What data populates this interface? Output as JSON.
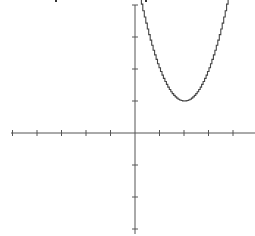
{
  "chart_data": {
    "type": "line",
    "title": "",
    "xlabel": "",
    "ylabel": "",
    "grid": false,
    "legend": null,
    "xlim": [
      -5,
      5
    ],
    "ylim": [
      -3,
      4
    ],
    "x_ticks": [
      -5,
      -4,
      -3,
      -2,
      -1,
      1,
      2,
      3,
      4
    ],
    "y_ticks": [
      -3,
      -2,
      -1,
      1,
      2,
      3,
      4
    ],
    "tick_labels_shown": false,
    "series": [
      {
        "name": "parabola",
        "equation": "y = (x - 2)^2 + 1",
        "vertex": [
          2,
          1
        ],
        "x": [
          0.2,
          0.5,
          0.8,
          1.0,
          1.2,
          1.4,
          1.6,
          1.8,
          2.0,
          2.2,
          2.4,
          2.6,
          2.8,
          3.0,
          3.2,
          3.4,
          3.6,
          3.8
        ],
        "y": [
          4.24,
          3.25,
          2.44,
          2.0,
          1.64,
          1.36,
          1.16,
          1.04,
          1.0,
          1.04,
          1.16,
          1.36,
          1.64,
          2.0,
          2.44,
          2.96,
          3.56,
          4.24
        ],
        "color": "#444444",
        "style": "jagged stair-step"
      }
    ],
    "layout": {
      "origin_px": [
        135,
        133
      ],
      "unit_px_x": 24.5,
      "unit_px_y": 32,
      "x_axis_px_range": [
        11,
        255
      ],
      "y_axis_px_range": [
        5,
        234
      ]
    }
  },
  "colors": {
    "axis": "#555555",
    "curve": "#444444",
    "background": "#ffffff"
  }
}
